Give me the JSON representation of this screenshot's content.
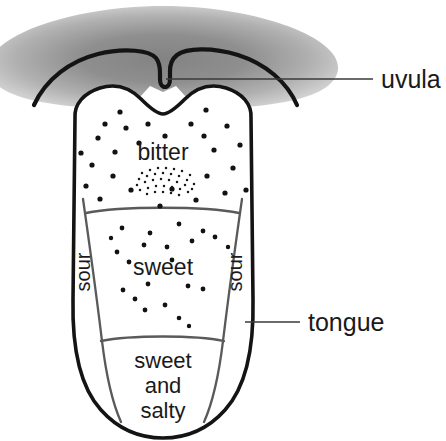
{
  "figure": {
    "background_color": "#ffffff",
    "ink_color": "#1a1a1a",
    "divider_color": "#555555",
    "palate_gray_center": "#8b8b8b",
    "palate_gray_edge": "#d9d9d9"
  },
  "callouts": [
    {
      "id": "uvula",
      "label": "uvula",
      "leader": "horizontal-line"
    },
    {
      "id": "tongue",
      "label": "tongue",
      "leader": "horizontal-line"
    }
  ],
  "regions": [
    {
      "id": "bitter",
      "label": "bitter",
      "position": "posterior"
    },
    {
      "id": "sour-left",
      "label": "sour",
      "position": "left-lateral",
      "rotation": -90
    },
    {
      "id": "sour-right",
      "label": "sour",
      "position": "right-lateral",
      "rotation": -90
    },
    {
      "id": "sweet",
      "label": "sweet",
      "position": "middle"
    },
    {
      "id": "sweet-and-salty",
      "label": "sweet\nand\nsalty",
      "lines": [
        "sweet",
        "and",
        "salty"
      ],
      "position": "anterior-tip"
    }
  ],
  "anatomy": {
    "soft_palate": "soft-palate-shape",
    "uvula": "uvula-shape",
    "tongue_outline": "tongue-shape",
    "papillae": "scattered-dots",
    "sulcus_terminalis": "arc-of-small-dots"
  }
}
